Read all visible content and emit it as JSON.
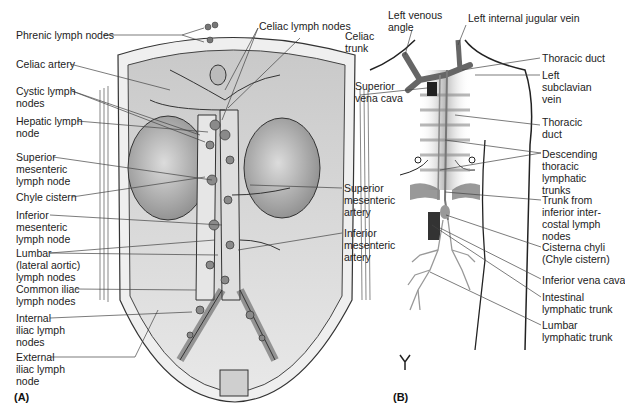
{
  "panel_a": {
    "letter": "(A)",
    "labels": {
      "phrenic": "Phrenic lymph nodes",
      "celiac_nodes": "Celiac lymph nodes",
      "celiac_trunk": "Celiac\ntrunk",
      "celiac_artery": "Celiac artery",
      "cystic": "Cystic lymph\nnodes",
      "hepatic": "Hepatic lymph\nnode",
      "sup_mes_node": "Superior\nmesenteric\nlymph node",
      "chyle": "Chyle cistern",
      "inf_mes_node": "Inferior\nmesenteric\nlymph node",
      "lumbar": "Lumbar\n(lateral aortic)\nlymph nodes",
      "common_iliac": "Common iliac\nlymph nodes",
      "internal_iliac": "Internal\niliac lymph\nnodes",
      "external_iliac": "External\niliac lymph\nnode",
      "sup_mes_artery": "Superior\nmesenteric\nartery",
      "inf_mes_artery": "Inferior\nmesenteric\nartery"
    }
  },
  "panel_b": {
    "letter": "(B)",
    "labels": {
      "venous_angle": "Left venous\nangle",
      "int_jugular": "Left internal jugular vein",
      "thoracic_duct_1": "Thoracic duct",
      "sup_vena_cava": "Superior\nvena cava",
      "left_subclavian": "Left\nsubclavian\nvein",
      "thoracic_duct_2": "Thoracic\nduct",
      "descending": "Descending\nthoracic\nlymphatic\ntrunks",
      "trunk_intercostal": "Trunk from\ninferior inter-\ncostal lymph\nnodes",
      "cisterna": "Cisterna chyli\n(Chyle cistern)",
      "inf_vena_cava": "Inferior vena cava",
      "intestinal": "Intestinal\nlymphatic trunk",
      "lumbar_trunk": "Lumbar\nlymphatic trunk"
    }
  },
  "colors": {
    "line": "#3a3a3a",
    "tissue": "#d6d6d6",
    "tissue_dark": "#9a9a9a",
    "background": "#ffffff"
  }
}
